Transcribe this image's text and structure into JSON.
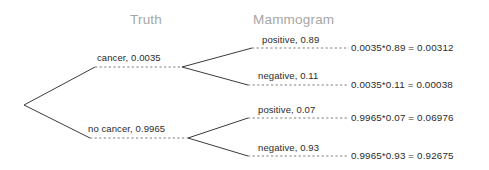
{
  "headers": {
    "truth": "Truth",
    "mammogram": "Mammogram"
  },
  "colors": {
    "header_text": "#a6a6a6",
    "label_text": "#2b2b2b",
    "line": "#3c3c3c",
    "dashed_line": "#6e6e6e",
    "background": "#ffffff"
  },
  "branches": {
    "level1": [
      {
        "label": "cancer,  0.0035",
        "outcome": "cancer",
        "probability": "0.0035"
      },
      {
        "label": "no cancer,  0.9965",
        "outcome": "no cancer",
        "probability": "0.9965"
      }
    ],
    "level2": [
      {
        "label": "positive,  0.89",
        "outcome": "positive",
        "probability": "0.89"
      },
      {
        "label": "negative,  0.11",
        "outcome": "negative",
        "probability": "0.11"
      },
      {
        "label": "positive,  0.07",
        "outcome": "positive",
        "probability": "0.07"
      },
      {
        "label": "negative,  0.93",
        "outcome": "negative",
        "probability": "0.93"
      }
    ]
  },
  "results": [
    {
      "expression": "0.0035*0.89  =  0.00312",
      "factor_a": "0.0035",
      "factor_b": "0.89",
      "product": "0.00312"
    },
    {
      "expression": "0.0035*0.11  =  0.00038",
      "factor_a": "0.0035",
      "factor_b": "0.11",
      "product": "0.00038"
    },
    {
      "expression": "0.9965*0.07  =  0.06976",
      "factor_a": "0.9965",
      "factor_b": "0.07",
      "product": "0.06976"
    },
    {
      "expression": "0.9965*0.93  =  0.92675",
      "factor_a": "0.9965",
      "factor_b": "0.93",
      "product": "0.92675"
    }
  ]
}
